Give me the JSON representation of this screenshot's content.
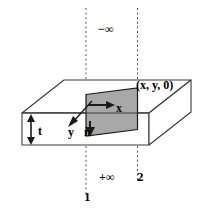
{
  "figure": {
    "type": "3d-slab-diagram",
    "colors": {
      "stroke": "#3a3a3a",
      "shaded_face": "#a8a8a8",
      "shaded_face_edge": "#1a1a1a",
      "dashed_line": "#555555",
      "background": "#ffffff",
      "text": "#000000"
    },
    "labels": {
      "infinity_negative": "−∞",
      "infinity_positive": "+∞",
      "boundary_one": "1",
      "boundary_two": "2",
      "point": "(x, y, 0)",
      "axis_x": "x",
      "axis_y": "y",
      "normal": "n",
      "thickness": "t"
    }
  }
}
